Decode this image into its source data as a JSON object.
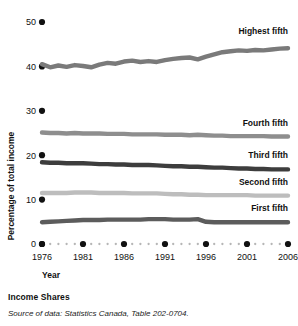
{
  "chart_data": {
    "type": "line",
    "title": "Income Shares",
    "xlabel": "Year",
    "ylabel": "Percentage of total income",
    "source_note": "Source of data: Statistics Canada, Table 202-0704.",
    "grid": false,
    "legend_position": "inline-right-of-series",
    "xlim": [
      1976,
      2006
    ],
    "ylim": [
      0,
      50
    ],
    "yticks": [
      0,
      10,
      20,
      30,
      40,
      50
    ],
    "ytick_labels": [
      "0",
      "10",
      "20",
      "30",
      "40",
      "50"
    ],
    "xticks": [
      1976,
      1981,
      1986,
      1991,
      1996,
      2001,
      2006
    ],
    "xtick_labels": [
      "1976",
      "1981",
      "1986",
      "1991",
      "1996",
      "2001",
      "2006"
    ],
    "x": [
      1976,
      1977,
      1978,
      1979,
      1980,
      1981,
      1982,
      1983,
      1984,
      1985,
      1986,
      1987,
      1988,
      1989,
      1990,
      1991,
      1992,
      1993,
      1994,
      1995,
      1996,
      1997,
      1998,
      1999,
      2000,
      2001,
      2002,
      2003,
      2004,
      2005,
      2006
    ],
    "series": [
      {
        "name": "Highest fifth",
        "color": "#7a7a7a",
        "values": [
          40.5,
          39.8,
          40.2,
          39.9,
          40.3,
          40.1,
          39.8,
          40.4,
          40.8,
          40.6,
          41.1,
          41.3,
          41.0,
          41.2,
          41.0,
          41.4,
          41.7,
          41.9,
          42.0,
          41.6,
          42.2,
          42.7,
          43.2,
          43.4,
          43.6,
          43.5,
          43.7,
          43.6,
          43.8,
          44.0,
          44.1
        ]
      },
      {
        "name": "Fourth fifth",
        "color": "#8e8e8e",
        "values": [
          25.1,
          25.0,
          25.0,
          24.9,
          25.0,
          24.9,
          24.9,
          24.9,
          24.8,
          24.8,
          24.8,
          24.7,
          24.7,
          24.7,
          24.7,
          24.6,
          24.6,
          24.6,
          24.5,
          24.6,
          24.5,
          24.4,
          24.4,
          24.3,
          24.3,
          24.3,
          24.3,
          24.3,
          24.2,
          24.2,
          24.2
        ]
      },
      {
        "name": "Third fifth",
        "color": "#3d3d3d",
        "values": [
          18.4,
          18.3,
          18.3,
          18.2,
          18.2,
          18.2,
          18.1,
          18.0,
          18.0,
          17.9,
          17.9,
          17.8,
          17.8,
          17.8,
          17.7,
          17.6,
          17.5,
          17.5,
          17.4,
          17.4,
          17.3,
          17.2,
          17.2,
          17.1,
          17.0,
          17.0,
          16.9,
          16.9,
          16.8,
          16.8,
          16.8
        ]
      },
      {
        "name": "Second fifth",
        "color": "#bdbdbd",
        "values": [
          11.5,
          11.5,
          11.5,
          11.5,
          11.6,
          11.6,
          11.6,
          11.5,
          11.5,
          11.5,
          11.5,
          11.4,
          11.4,
          11.4,
          11.4,
          11.3,
          11.2,
          11.2,
          11.1,
          11.1,
          11.0,
          11.0,
          11.0,
          11.0,
          11.0,
          11.0,
          10.9,
          10.9,
          10.9,
          10.9,
          10.9
        ]
      },
      {
        "name": "First fifth",
        "color": "#5c5c5c",
        "values": [
          4.9,
          5.0,
          5.1,
          5.2,
          5.3,
          5.4,
          5.4,
          5.4,
          5.5,
          5.5,
          5.5,
          5.5,
          5.5,
          5.6,
          5.6,
          5.6,
          5.5,
          5.5,
          5.5,
          5.6,
          5.0,
          4.9,
          4.9,
          4.9,
          4.9,
          4.9,
          4.9,
          4.9,
          4.9,
          4.9,
          4.9
        ]
      }
    ]
  },
  "caption": {
    "title": "Income Shares",
    "source": "Source of data: Statistics Canada, Table 202-0704."
  },
  "axis": {
    "x_title": "Year",
    "y_title": "Percentage of total income"
  }
}
